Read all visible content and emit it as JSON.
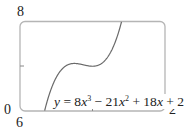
{
  "chart_data": {
    "type": "line",
    "title": "",
    "xlabel": "",
    "ylabel": "",
    "xlim": [
      0,
      2
    ],
    "ylim": [
      6,
      8
    ],
    "grid": false,
    "series": [
      {
        "name": "y = 8x^3 - 21x^2 + 18x + 2",
        "function": "8x^3 - 21x^2 + 18x + 2",
        "x": [
          0.34,
          0.4,
          0.5,
          0.6,
          0.75,
          0.9,
          1.0,
          1.1,
          1.2,
          1.3,
          1.4
        ],
        "values": [
          6.0,
          6.27,
          6.75,
          6.97,
          7.06,
          7.03,
          7.0,
          7.03,
          7.14,
          7.47,
          8.0
        ]
      }
    ],
    "axis_labels": {
      "x_min": "0",
      "x_max": "2",
      "y_min": "6",
      "y_max": "8"
    },
    "ticks": {
      "x": [
        1
      ],
      "y": [
        7
      ]
    },
    "annotations": [
      {
        "text": "y = 8x³ − 21x² + 18x + 2",
        "position": "bottom-center"
      }
    ],
    "line_color": "#6a6a6a",
    "frame_color": "#b5b5b5"
  },
  "labels": {
    "y_max": "8",
    "y_min": "6",
    "x_min": "0",
    "x_max": "2"
  },
  "equation": {
    "lhs": "y",
    "eq": " = 8",
    "x1": "x",
    "p1": "3",
    "t2": " − 21",
    "x2": "x",
    "p2": "2",
    "t3": " + 18",
    "x3": "x",
    "t4": " + 2"
  }
}
